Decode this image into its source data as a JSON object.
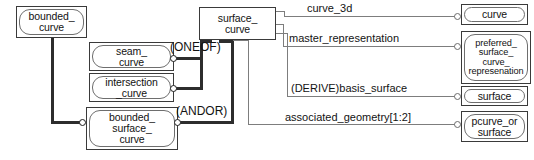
{
  "diagram": {
    "type": "express-g-entity-diagram",
    "entities": [
      {
        "id": "bounded_curve",
        "label": "bounded_\ncurve",
        "style": "rounded"
      },
      {
        "id": "seam_curve",
        "label": "seam_\ncurve",
        "style": "rounded"
      },
      {
        "id": "intersection_curve",
        "label": "intersection\n_curve",
        "style": "rounded"
      },
      {
        "id": "bounded_surface_curve",
        "label": "bounded_\nsurface_\ncurve",
        "style": "rounded"
      },
      {
        "id": "surface_curve",
        "label": "surface_\ncurve",
        "style": "plain"
      },
      {
        "id": "curve",
        "label": "curve",
        "style": "rounded"
      },
      {
        "id": "preferred_surface_curve_represenation",
        "label": "preferred_\nsurface_\ncurve_\nrepresenation",
        "style": "rounded"
      },
      {
        "id": "surface",
        "label": "surface",
        "style": "rounded"
      },
      {
        "id": "pcurve_or_surface",
        "label": "pcurve_or\nsurface",
        "style": "rounded"
      }
    ],
    "constraint_labels": [
      {
        "id": "oneof",
        "text": "(ONEOF)"
      },
      {
        "id": "andor",
        "text": "(ANDOR)"
      }
    ],
    "attribute_labels": [
      {
        "id": "curve_3d",
        "text": "curve_3d",
        "target": "curve"
      },
      {
        "id": "master_representation",
        "text": "master_representation",
        "target": "preferred_surface_curve_represenation"
      },
      {
        "id": "basis_surface",
        "text": "(DERIVE)basis_surface",
        "target": "surface"
      },
      {
        "id": "associated_geometry",
        "text": "associated_geometry[1:2]",
        "target": "pcurve_or_surface"
      }
    ],
    "colors": {
      "background": "#ffffff",
      "box_border": "#3a3a3a",
      "inner_border": "#6e6e6e",
      "text": "#121212",
      "line_thick": "#2d2d2d",
      "line_thin": "#7d7d7d"
    }
  }
}
